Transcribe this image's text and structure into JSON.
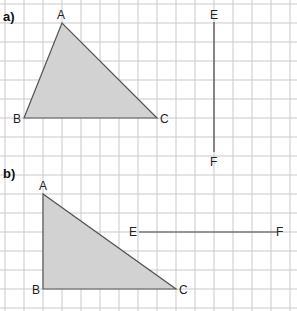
{
  "diagram": {
    "grid": {
      "spacing": 19,
      "origin_x": 5,
      "origin_y": 4,
      "cols": 16,
      "rows": 17,
      "color": "#c9c9c9"
    },
    "fill_color": "#d2d2d2",
    "stroke_color": "#555555",
    "parts": [
      {
        "label": "a)",
        "label_pos": [
          3,
          21
        ],
        "triangle": {
          "points": [
            {
              "name": "A",
              "x": 62,
              "y": 23,
              "lx": 57,
              "ly": 19
            },
            {
              "name": "B",
              "x": 24,
              "y": 118,
              "lx": 13,
              "ly": 123
            },
            {
              "name": "C",
              "x": 157,
              "y": 118,
              "lx": 160,
              "ly": 123
            }
          ]
        },
        "segment": {
          "start": {
            "name": "E",
            "x": 214,
            "y": 22,
            "lx": 210,
            "ly": 19
          },
          "end": {
            "name": "F",
            "x": 214,
            "y": 152,
            "lx": 210,
            "ly": 166
          }
        }
      },
      {
        "label": "b)",
        "label_pos": [
          3,
          178
        ],
        "triangle": {
          "points": [
            {
              "name": "A",
              "x": 43,
              "y": 194,
              "lx": 39,
              "ly": 190
            },
            {
              "name": "B",
              "x": 43,
              "y": 289,
              "lx": 32,
              "ly": 294
            },
            {
              "name": "C",
              "x": 176,
              "y": 289,
              "lx": 179,
              "ly": 294
            }
          ]
        },
        "segment": {
          "start": {
            "name": "E",
            "x": 139,
            "y": 232,
            "lx": 129,
            "ly": 236
          },
          "end": {
            "name": "F",
            "x": 277,
            "y": 232,
            "lx": 276,
            "ly": 236
          }
        }
      }
    ]
  }
}
